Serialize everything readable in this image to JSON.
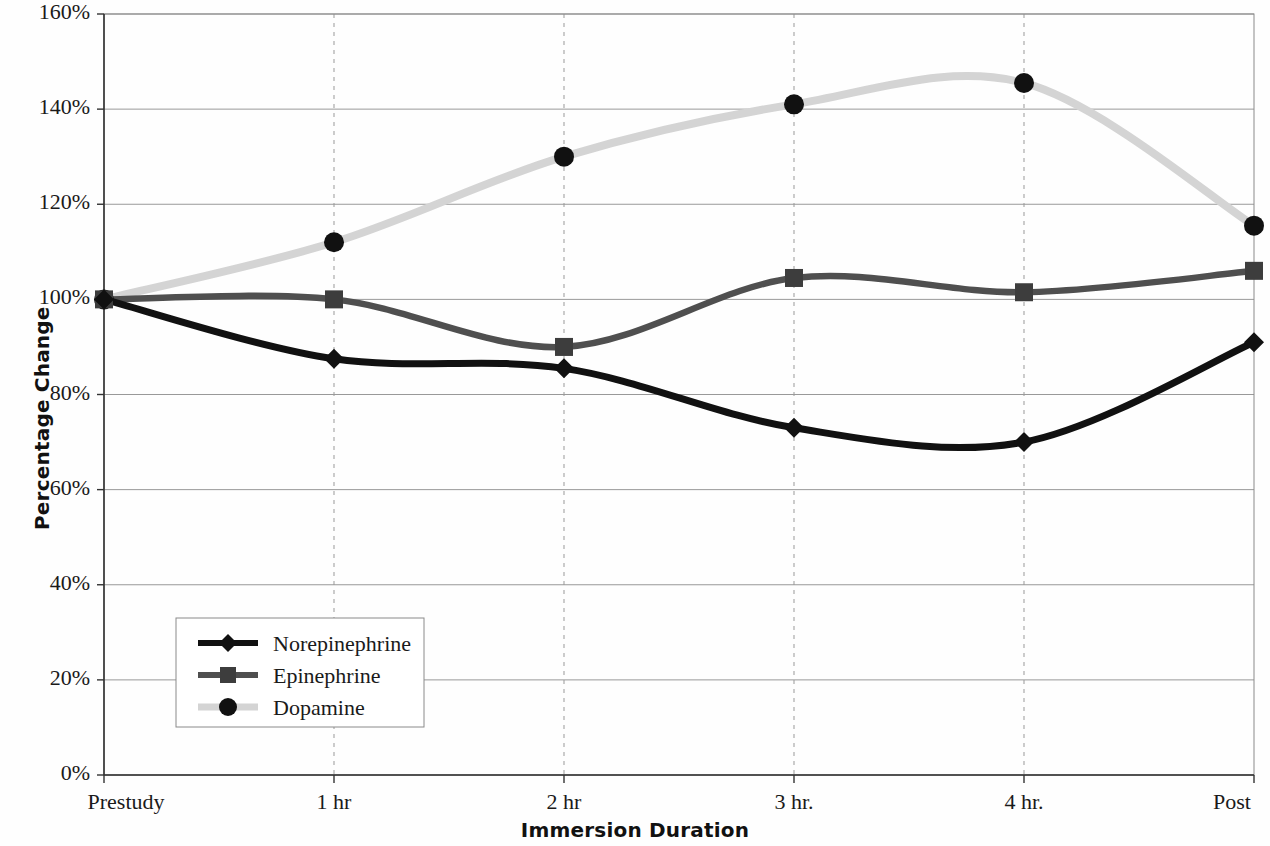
{
  "chart_data": {
    "type": "line",
    "title": "",
    "xlabel": "Immersion Duration",
    "ylabel": "Percentage Change",
    "categories": [
      "Prestudy",
      "1 hr",
      "2 hr",
      "3 hr.",
      "4 hr.",
      "Post"
    ],
    "x_tick_labels": [
      "Prestudy",
      "1 hr",
      "2 hr",
      "3 hr.",
      "4 hr.",
      "Post"
    ],
    "y_tick_labels": [
      "0%",
      "20%",
      "40%",
      "60%",
      "80%",
      "100%",
      "120%",
      "140%",
      "160%"
    ],
    "y_tick_values": [
      0,
      20,
      40,
      60,
      80,
      100,
      120,
      140,
      160
    ],
    "ylim": [
      0,
      160
    ],
    "grid": "horizontal-solid-and-vertical-dashed",
    "legend_position": "inside-lower-left",
    "smoothing": "spline",
    "series": [
      {
        "name": "Norepinephrine",
        "marker": "diamond",
        "color": "#111111",
        "values": [
          100,
          87.5,
          85.5,
          73,
          70,
          91
        ]
      },
      {
        "name": "Epinephrine",
        "marker": "square",
        "color": "#4f4f4f",
        "values": [
          100,
          100,
          90,
          104.5,
          101.5,
          106
        ]
      },
      {
        "name": "Dopamine",
        "marker": "circle",
        "color": "#d4d4d4",
        "values": [
          100,
          112,
          130,
          141,
          145.5,
          115.5
        ]
      }
    ]
  },
  "legend": {
    "items": [
      {
        "label": "Norepinephrine"
      },
      {
        "label": "Epinephrine"
      },
      {
        "label": "Dopamine"
      }
    ]
  },
  "axes": {
    "y_title": "Percentage Change",
    "x_title": "Immersion Duration"
  },
  "colors": {
    "norepinephrine": "#111111",
    "epinephrine": "#4f4f4f",
    "dopamine": "#d4d4d4",
    "marker_fill": "#111111",
    "gridline": "#999999",
    "axis": "#333333",
    "background": "#fefefe"
  }
}
